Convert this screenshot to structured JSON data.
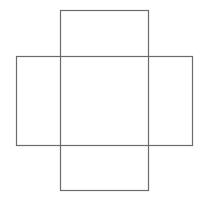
{
  "diagram": {
    "title": "",
    "canvas": {
      "width": 202,
      "height": 203,
      "background": "#ffffff"
    },
    "stroke_color": "#6b6b6b",
    "stroke_width": 1.2,
    "shapes": [
      {
        "id": "vertical-rect",
        "x": 60,
        "y": 10,
        "width": 88,
        "height": 180
      },
      {
        "id": "horizontal-rect",
        "x": 16,
        "y": 56,
        "width": 176,
        "height": 89
      }
    ]
  }
}
